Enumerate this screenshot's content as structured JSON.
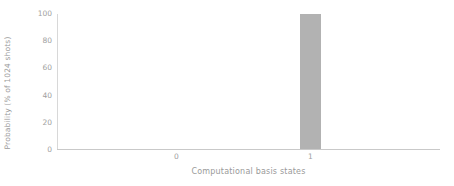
{
  "chart_data": {
    "type": "bar",
    "title": "",
    "xlabel": "Computational basis states",
    "ylabel": "Probability (% of 1024 shots)",
    "categories": [
      "0",
      "1"
    ],
    "values": [
      0,
      100
    ],
    "series": [
      {
        "name": "Probability",
        "values": [
          0,
          100
        ],
        "color": "#b2b2b2"
      }
    ],
    "ylim": [
      0,
      100
    ],
    "yticks": [
      0,
      20,
      40,
      60,
      80,
      100
    ],
    "ytick_labels": [
      "0",
      "20",
      "40",
      "60",
      "80",
      "100"
    ],
    "xtick_labels": [
      "0",
      "1"
    ],
    "grid": false,
    "legend": false,
    "legend_position": "none",
    "spines": [
      "left",
      "bottom"
    ],
    "bar_color": "#b2b2b2",
    "axis_color": "#c9c9c9",
    "text_color": "#9a9a9a",
    "background": "#ffffff"
  }
}
